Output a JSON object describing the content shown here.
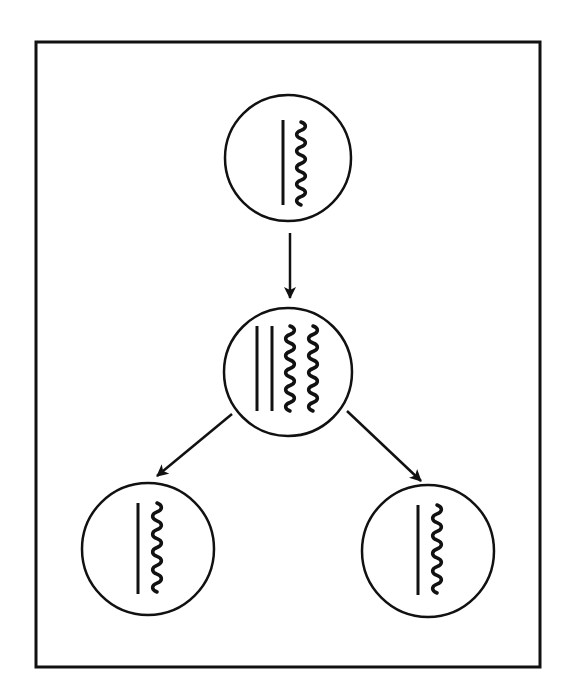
{
  "diagram": {
    "colors": {
      "stroke": "#111111",
      "background": "#ffffff"
    },
    "frame": {
      "x": 36,
      "y": 42,
      "width": 504,
      "height": 625
    },
    "cells": [
      {
        "id": "parent-cell",
        "label": "Parent cell",
        "cx": 288,
        "cy": 158,
        "r": 63,
        "straight_strands": [
          {
            "x": 283,
            "y1": 120,
            "y2": 205
          }
        ],
        "wavy_strands": [
          {
            "x": 301,
            "y1": 122,
            "y2": 205
          }
        ]
      },
      {
        "id": "replicated-cell",
        "label": "Replicated cell",
        "cx": 288,
        "cy": 372,
        "r": 64,
        "straight_strands": [
          {
            "x": 257,
            "y1": 326,
            "y2": 411
          },
          {
            "x": 272,
            "y1": 326,
            "y2": 411
          }
        ],
        "wavy_strands": [
          {
            "x": 290,
            "y1": 326,
            "y2": 411
          },
          {
            "x": 313,
            "y1": 326,
            "y2": 411
          }
        ]
      },
      {
        "id": "daughter-cell-left",
        "label": "Daughter cell (left)",
        "cx": 148,
        "cy": 549,
        "r": 66,
        "straight_strands": [
          {
            "x": 138,
            "y1": 503,
            "y2": 594
          }
        ],
        "wavy_strands": [
          {
            "x": 157,
            "y1": 503,
            "y2": 592
          }
        ]
      },
      {
        "id": "daughter-cell-right",
        "label": "Daughter cell (right)",
        "cx": 428,
        "cy": 551,
        "r": 66,
        "straight_strands": [
          {
            "x": 418,
            "y1": 505,
            "y2": 595
          }
        ],
        "wavy_strands": [
          {
            "x": 437,
            "y1": 505,
            "y2": 593
          }
        ]
      }
    ],
    "arrows": [
      {
        "id": "arrow-parent-to-replicated",
        "x1": 290,
        "y1": 233,
        "x2": 290,
        "y2": 298
      },
      {
        "id": "arrow-replicated-to-left",
        "x1": 232,
        "y1": 414,
        "x2": 157,
        "y2": 476
      },
      {
        "id": "arrow-replicated-to-right",
        "x1": 347,
        "y1": 411,
        "x2": 421,
        "y2": 481
      }
    ]
  }
}
